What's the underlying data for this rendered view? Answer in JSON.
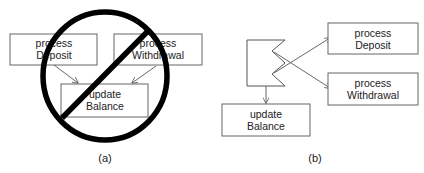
{
  "panel_a": {
    "caption": "(a)",
    "boxes": {
      "deposit": {
        "line1": "process",
        "line2": "Deposit"
      },
      "withdrawal": {
        "line1": "process",
        "line2": "Withdrawal"
      },
      "update": {
        "line1": "update",
        "line2": "Balance"
      }
    },
    "prohibition_sign": "no-symbol"
  },
  "panel_b": {
    "caption": "(b)",
    "boxes": {
      "deposit": {
        "line1": "process",
        "line2": "Deposit"
      },
      "withdrawal": {
        "line1": "process",
        "line2": "Withdrawal"
      },
      "update": {
        "line1": "update",
        "line2": "Balance"
      }
    },
    "connector_shape": "zigzag-dispatcher"
  },
  "colors": {
    "line": "#555555",
    "prohibition": "#000000",
    "text": "#222222",
    "background": "#ffffff"
  }
}
